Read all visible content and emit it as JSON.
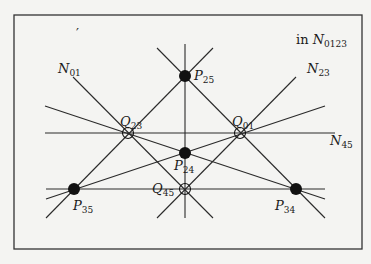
{
  "diagram": {
    "caption": {
      "prefix": "in ",
      "main": "N",
      "sub": "0123"
    },
    "frame": {
      "x": 14,
      "y": 15,
      "width": 348,
      "height": 234,
      "stroke": "#333333"
    },
    "background": "#f4f4f2",
    "line_color": "#2a2a2a",
    "points": [
      {
        "id": "P25",
        "label": "P",
        "sub": "25",
        "x": 185,
        "y": 76,
        "type": "filled",
        "lx": 194,
        "ly": 80
      },
      {
        "id": "P24",
        "label": "P",
        "sub": "24",
        "x": 185,
        "y": 153,
        "type": "filled",
        "lx": 174,
        "ly": 170
      },
      {
        "id": "P35",
        "label": "P",
        "sub": "35",
        "x": 74,
        "y": 189,
        "type": "filled",
        "lx": 73,
        "ly": 210
      },
      {
        "id": "P34",
        "label": "P",
        "sub": "34",
        "x": 296,
        "y": 189,
        "type": "filled",
        "lx": 275,
        "ly": 210
      },
      {
        "id": "Q23",
        "label": "Q",
        "sub": "23",
        "x": 128,
        "y": 133,
        "type": "open",
        "lx": 120,
        "ly": 126
      },
      {
        "id": "Q01",
        "label": "Q",
        "sub": "01",
        "x": 240,
        "y": 133,
        "type": "open",
        "lx": 232,
        "ly": 126
      },
      {
        "id": "Q45",
        "label": "Q",
        "sub": "45",
        "x": 185,
        "y": 189,
        "type": "open",
        "lx": 152,
        "ly": 193
      }
    ],
    "line_labels": [
      {
        "id": "N01",
        "label": "N",
        "sub": "01",
        "x": 58,
        "y": 73
      },
      {
        "id": "N23",
        "label": "N",
        "sub": "23",
        "x": 307,
        "y": 73
      },
      {
        "id": "N45",
        "label": "N",
        "sub": "45",
        "x": 330,
        "y": 145
      }
    ],
    "lines": [
      {
        "id": "N01",
        "x1": 73,
        "y1": 77,
        "x2": 213,
        "y2": 218
      },
      {
        "id": "N23",
        "x1": 296,
        "y1": 77,
        "x2": 157,
        "y2": 218
      },
      {
        "id": "P25-P34",
        "x1": 157,
        "y1": 48,
        "x2": 325,
        "y2": 218
      },
      {
        "id": "P25-P35",
        "x1": 213,
        "y1": 48,
        "x2": 46,
        "y2": 218
      },
      {
        "id": "N45",
        "x1": 45,
        "y1": 133,
        "x2": 335,
        "y2": 133
      },
      {
        "id": "P35-P34",
        "x1": 46,
        "y1": 189,
        "x2": 325,
        "y2": 189
      },
      {
        "id": "vertical",
        "x1": 185,
        "y1": 44,
        "x2": 185,
        "y2": 218
      },
      {
        "id": "Q23-P34",
        "x1": 45,
        "y1": 106,
        "x2": 325,
        "y2": 199
      },
      {
        "id": "Q01-P35",
        "x1": 325,
        "y1": 106,
        "x2": 46,
        "y2": 199
      }
    ],
    "stray_mark": {
      "text": "′",
      "x": 76,
      "y": 38
    }
  }
}
